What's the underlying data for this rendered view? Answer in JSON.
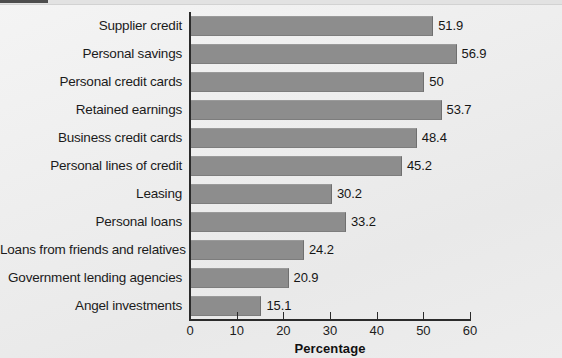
{
  "chart_data": {
    "type": "bar",
    "orientation": "horizontal",
    "title": "",
    "subtitle": "",
    "xlabel": "Percentage",
    "ylabel": "",
    "xlim": [
      0,
      60
    ],
    "x_ticks": [
      0,
      10,
      20,
      30,
      40,
      50,
      60
    ],
    "x_tick_labels": [
      "0",
      "10",
      "20",
      "30",
      "40",
      "50",
      "60"
    ],
    "grid": false,
    "legend": false,
    "legend_position": "none",
    "bar_color": "#8d8d8d",
    "axis_color": "#2b2b2b",
    "background_color": "#eeeeee",
    "accent_color": "#4d4d4d",
    "categories": [
      "Supplier credit",
      "Personal savings",
      "Personal credit cards",
      "Retained earnings",
      "Business credit cards",
      "Personal lines of credit",
      "Leasing",
      "Personal loans",
      "Loans from friends and relatives",
      "Government lending agencies",
      "Angel investments"
    ],
    "values": [
      51.9,
      56.9,
      50,
      53.7,
      48.4,
      45.2,
      30.2,
      33.2,
      24.2,
      20.9,
      15.1
    ],
    "value_labels": [
      "51.9",
      "56.9",
      "50",
      "53.7",
      "48.4",
      "45.2",
      "30.2",
      "33.2",
      "24.2",
      "20.9",
      "15.1"
    ]
  }
}
